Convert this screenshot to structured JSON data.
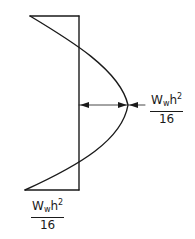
{
  "diagram": {
    "line_color": "#1a1a1a",
    "labels": {
      "midspan": {
        "base": "W",
        "sub": "w",
        "var": "h",
        "sup": "2",
        "den": "16"
      },
      "end": {
        "base": "W",
        "sub": "w",
        "var": "h",
        "sup": "2",
        "den": "16"
      }
    }
  }
}
